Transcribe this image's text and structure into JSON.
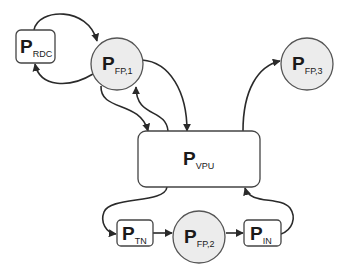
{
  "colors": {
    "background": "#ffffff",
    "circle_fill": "#ececec",
    "stroke": "#444444",
    "text": "#1a1a1a",
    "edge": "#2a2a2a"
  },
  "nodes": {
    "rdc": {
      "shape": "rounded-rect",
      "main": "P",
      "sub": "RDC"
    },
    "fp1": {
      "shape": "circle",
      "main": "P",
      "sub": "FP,1"
    },
    "fp3": {
      "shape": "circle",
      "main": "P",
      "sub": "FP,3"
    },
    "vpu": {
      "shape": "rounded-rect",
      "main": "P",
      "sub": "VPU"
    },
    "tn": {
      "shape": "rounded-rect",
      "main": "P",
      "sub": "TN"
    },
    "fp2": {
      "shape": "circle",
      "main": "P",
      "sub": "FP,2"
    },
    "in": {
      "shape": "rounded-rect",
      "main": "P",
      "sub": "IN"
    }
  },
  "edges": [
    {
      "from": "rdc",
      "to": "fp1"
    },
    {
      "from": "fp1",
      "to": "rdc"
    },
    {
      "from": "fp1",
      "to": "vpu"
    },
    {
      "from": "vpu",
      "to": "fp1"
    },
    {
      "from": "fp1",
      "to": "vpu"
    },
    {
      "from": "vpu",
      "to": "fp3"
    },
    {
      "from": "vpu",
      "to": "tn"
    },
    {
      "from": "tn",
      "to": "fp2"
    },
    {
      "from": "fp2",
      "to": "in"
    },
    {
      "from": "in",
      "to": "vpu"
    }
  ]
}
